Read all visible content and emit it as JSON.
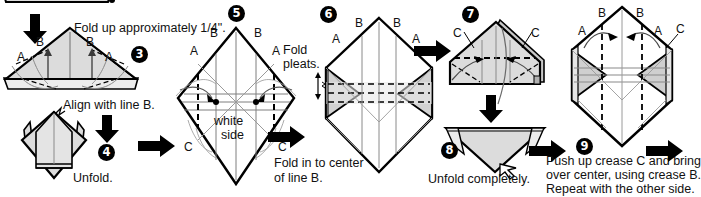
{
  "document": {
    "title": "Origami folding instructions steps 3 to 9",
    "type": "instructional-diagram"
  },
  "colors": {
    "paper_fill": "#dcdcdc",
    "paper_fill_light": "#efefef",
    "paper_fill_dark": "#b8b8b8",
    "outline": "#000000",
    "crease_gray": "#8a8a8a",
    "text": "#111111",
    "arrow": "#000000"
  },
  "captions": {
    "fold_up_quarter_pre": "Fold up approximately ",
    "fold_up_quarter_frac": "1/4",
    "fold_up_quarter_post": "\".",
    "fold_up_quarter_full": "Fold up approximately 1/4\".",
    "align_with_line_b": "Align with line B.",
    "unfold": "Unfold.",
    "white_side_line1": "white",
    "white_side_line2": "side",
    "fold_in_to_center_line1": "Fold in to center",
    "fold_in_to_center_line2": "of line B.",
    "fold_pleats_line1": "Fold",
    "fold_pleats_line2": "pleats.",
    "unfold_completely": "Unfold completely.",
    "push_up_line1": "Push up crease C and bring",
    "push_up_line2": "over center, using crease B.",
    "push_up_line3": "Repeat with the other side."
  },
  "steps": [
    {
      "number": "3",
      "label": "3"
    },
    {
      "number": "4",
      "label": "4"
    },
    {
      "number": "5",
      "label": "5"
    },
    {
      "number": "6",
      "label": "6"
    },
    {
      "number": "7",
      "label": "7"
    },
    {
      "number": "8",
      "label": "8"
    },
    {
      "number": "9",
      "label": "9"
    }
  ],
  "crease_labels": {
    "a": "A",
    "b": "B",
    "c": "C"
  },
  "panel3": {
    "step": "3",
    "labels": [
      {
        "text": "B",
        "role": "crease-b-left"
      },
      {
        "text": "B",
        "role": "crease-b-right"
      },
      {
        "text": "A",
        "role": "crease-a-left"
      },
      {
        "text": "A",
        "role": "crease-a-right"
      }
    ],
    "shape": "triangle-with-base-flap"
  },
  "panel4": {
    "step": "4",
    "caption": "Unfold.",
    "above_caption": "Align with line B.",
    "shape": "diamond-with-side-flaps"
  },
  "panel5": {
    "step": "5",
    "labels": [
      {
        "text": "B",
        "role": "crease-b-left"
      },
      {
        "text": "B",
        "role": "crease-b-right"
      },
      {
        "text": "A",
        "role": "crease-a-left"
      },
      {
        "text": "A",
        "role": "crease-a-right"
      },
      {
        "text": "C",
        "role": "crease-c-left"
      },
      {
        "text": "C",
        "role": "crease-c-right"
      }
    ],
    "center_text_line1": "white",
    "center_text_line2": "side",
    "caption_line1": "Fold in to center",
    "caption_line2": "of line B.",
    "shape": "diamond-creased"
  },
  "panel6": {
    "step": "6",
    "labels": [
      {
        "text": "B",
        "role": "crease-b-left"
      },
      {
        "text": "B",
        "role": "crease-b-right"
      },
      {
        "text": "A",
        "role": "crease-a-left"
      },
      {
        "text": "A",
        "role": "crease-a-right"
      }
    ],
    "side_caption_line1": "Fold",
    "side_caption_line2": "pleats.",
    "shape": "hexagon-folded-sides"
  },
  "panel7": {
    "step": "7",
    "labels": [
      {
        "text": "C",
        "role": "crease-c-left"
      },
      {
        "text": "C",
        "role": "crease-c-right"
      }
    ],
    "shape": "pentagon-house"
  },
  "panel8": {
    "step": "8",
    "caption": "Unfold completely.",
    "shape": "inverted-triangle"
  },
  "panel9": {
    "step": "9",
    "labels": [
      {
        "text": "B",
        "role": "crease-b-left"
      },
      {
        "text": "B",
        "role": "crease-b-right"
      },
      {
        "text": "A",
        "role": "crease-a-left"
      },
      {
        "text": "A",
        "role": "crease-a-right"
      },
      {
        "text": "C",
        "role": "crease-c-right"
      }
    ],
    "caption_line1": "Push up crease C and bring",
    "caption_line2": "over center, using crease B.",
    "caption_line3": "Repeat with the other side.",
    "shape": "hexagon-folded-sides"
  },
  "arrows": [
    {
      "role": "down-arrow-to-step3",
      "direction": "down"
    },
    {
      "role": "down-arrow-to-step4",
      "direction": "down"
    },
    {
      "role": "right-arrow-step4-to-5",
      "direction": "right"
    },
    {
      "role": "right-arrow-step5-to-6",
      "direction": "right"
    },
    {
      "role": "right-arrow-step6-to-7",
      "direction": "right"
    },
    {
      "role": "down-arrow-step7-to-8",
      "direction": "down"
    },
    {
      "role": "right-arrow-step8-to-9",
      "direction": "right"
    },
    {
      "role": "right-arrow-step9-next",
      "direction": "right"
    }
  ]
}
